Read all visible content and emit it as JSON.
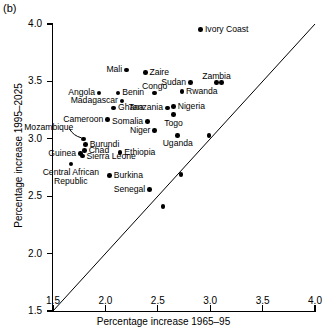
{
  "panel": {
    "label": "(b)"
  },
  "chart_data": {
    "type": "scatter",
    "title": "",
    "subtitle": "",
    "xlabel": "Percentage increase 1965–95",
    "ylabel": "Percentage increase 1995–2025",
    "xlim": [
      1.5,
      4.0
    ],
    "ylim": [
      1.5,
      4.0
    ],
    "xticks": [
      "1.5",
      "2.0",
      "2.5",
      "3.0",
      "3.5",
      "4.0"
    ],
    "yticks": [
      "1.5",
      "2.0",
      "2.5",
      "3.0",
      "3.5",
      "4.0"
    ],
    "xtick_values": [
      1.5,
      2.0,
      2.5,
      3.0,
      3.5,
      4.0
    ],
    "ytick_values": [
      1.5,
      2.0,
      2.5,
      3.0,
      3.5,
      4.0
    ],
    "grid": false,
    "legend": "none",
    "annotations": [
      {
        "text": "y = x reference line",
        "type": "line",
        "from": [
          1.5,
          1.5
        ],
        "to": [
          4.0,
          4.0
        ]
      }
    ],
    "points": [
      {
        "label": "Ivory Coast",
        "x": 2.91,
        "y": 3.95,
        "label_pos": "right"
      },
      {
        "label": "Mali",
        "x": 2.2,
        "y": 3.6,
        "label_pos": "left"
      },
      {
        "label": "Zaire",
        "x": 2.38,
        "y": 3.58,
        "label_pos": "right"
      },
      {
        "label": "Zambia",
        "x": 3.06,
        "y": 3.49,
        "label_pos": "above"
      },
      {
        "label": "",
        "x": 3.11,
        "y": 3.49,
        "label_pos": "none"
      },
      {
        "label": "Sudan",
        "x": 2.81,
        "y": 3.49,
        "label_pos": "left"
      },
      {
        "label": "Benin",
        "x": 2.12,
        "y": 3.4,
        "label_pos": "right"
      },
      {
        "label": "Angola",
        "x": 1.94,
        "y": 3.4,
        "label_pos": "left"
      },
      {
        "label": "Congo",
        "x": 2.47,
        "y": 3.4,
        "label_pos": "above"
      },
      {
        "label": "Rwanda",
        "x": 2.73,
        "y": 3.41,
        "label_pos": "right"
      },
      {
        "label": "Madagascar",
        "x": 2.16,
        "y": 3.33,
        "label_pos": "left"
      },
      {
        "label": "Tanzania",
        "x": 2.59,
        "y": 3.27,
        "label_pos": "left"
      },
      {
        "label": "Nigeria",
        "x": 2.65,
        "y": 3.28,
        "label_pos": "right"
      },
      {
        "label": "Ghana",
        "x": 2.08,
        "y": 3.27,
        "label_pos": "right"
      },
      {
        "label": "Togo",
        "x": 2.65,
        "y": 3.21,
        "label_pos": "below"
      },
      {
        "label": "Cameroon",
        "x": 2.02,
        "y": 3.17,
        "label_pos": "left"
      },
      {
        "label": "Somalia",
        "x": 2.4,
        "y": 3.15,
        "label_pos": "left"
      },
      {
        "label": "Niger",
        "x": 2.47,
        "y": 3.07,
        "label_pos": "left"
      },
      {
        "label": "Uganda",
        "x": 2.69,
        "y": 3.03,
        "label_pos": "below"
      },
      {
        "label": "",
        "x": 2.99,
        "y": 3.03,
        "label_pos": "none"
      },
      {
        "label": "Mozambique",
        "x": 1.79,
        "y": 3.0,
        "label_pos": "leader"
      },
      {
        "label": "Burundi",
        "x": 1.81,
        "y": 2.95,
        "label_pos": "right"
      },
      {
        "label": "Chad",
        "x": 1.8,
        "y": 2.9,
        "label_pos": "right"
      },
      {
        "label": "Guinea",
        "x": 1.76,
        "y": 2.87,
        "label_pos": "left"
      },
      {
        "label": "Sierra Leone",
        "x": 1.78,
        "y": 2.85,
        "label_pos": "right"
      },
      {
        "label": "Ethiopia",
        "x": 2.14,
        "y": 2.88,
        "label_pos": "right"
      },
      {
        "label": "Central African Republic",
        "x": 1.67,
        "y": 2.78,
        "label_pos": "below"
      },
      {
        "label": "Burkina",
        "x": 2.04,
        "y": 2.68,
        "label_pos": "right"
      },
      {
        "label": "",
        "x": 2.72,
        "y": 2.69,
        "label_pos": "none"
      },
      {
        "label": "Senegal",
        "x": 2.42,
        "y": 2.56,
        "label_pos": "left"
      },
      {
        "label": "",
        "x": 2.55,
        "y": 2.41,
        "label_pos": "none"
      }
    ]
  }
}
